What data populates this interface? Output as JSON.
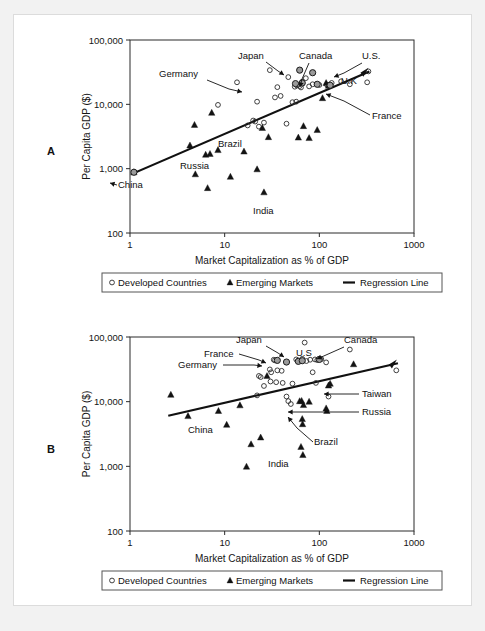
{
  "figure": {
    "background_color": "#f2f2f2",
    "card_color": "#ffffff",
    "panels": [
      {
        "letter": "A"
      },
      {
        "letter": "B"
      }
    ]
  },
  "legend": {
    "developed_label": "Developed Countries",
    "emerging_label": "Emerging Markets",
    "regression_label": "Regression Line",
    "developed_marker": "open-circle-icon",
    "emerging_marker": "filled-triangle-icon",
    "regression_marker": "line-segment-icon"
  },
  "chart_data": [
    {
      "panel": "A",
      "type": "scatter",
      "title": "",
      "xlabel": "Market Capitalization as % of GDP",
      "ylabel": "Per Capita GDP ($)",
      "xscale": "log",
      "yscale": "log",
      "xlim": [
        1,
        1000
      ],
      "ylim": [
        100,
        100000
      ],
      "xticks": [
        1,
        10,
        100,
        1000
      ],
      "xticklabels": [
        "1",
        "10",
        "100",
        "1000"
      ],
      "yticks": [
        100,
        1000,
        10000,
        100000
      ],
      "yticklabels": [
        "100",
        "1,000",
        "10,000",
        "100,000"
      ],
      "grid": false,
      "legend_position": "below-axis",
      "series": [
        {
          "name": "Developed Countries",
          "marker": "open-circle",
          "points": [
            [
              13.5,
              22000
            ],
            [
              8.5,
              9800
            ],
            [
              22.0,
              11000
            ],
            [
              30.0,
              34000
            ],
            [
              36.0,
              18500
            ],
            [
              34.0,
              12800
            ],
            [
              39.0,
              13500
            ],
            [
              47.0,
              26500
            ],
            [
              55.0,
              18800
            ],
            [
              58.0,
              19600
            ],
            [
              62.0,
              19200
            ],
            [
              64.0,
              18300
            ],
            [
              66.0,
              22500
            ],
            [
              72.0,
              25500
            ],
            [
              78.0,
              19000
            ],
            [
              85.0,
              20500
            ],
            [
              100.0,
              20000
            ],
            [
              120.0,
              20200
            ],
            [
              135.0,
              21500
            ],
            [
              170.0,
              22800
            ],
            [
              210.0,
              20500
            ],
            [
              320.0,
              22000
            ],
            [
              330.0,
              32500
            ],
            [
              17.5,
              4700
            ],
            [
              20.0,
              5600
            ],
            [
              21.0,
              5400
            ],
            [
              23.0,
              4500
            ],
            [
              26.0,
              5200
            ],
            [
              45.0,
              5000
            ],
            [
              52.0,
              10800
            ],
            [
              57.0,
              11000
            ]
          ]
        },
        {
          "name": "Emerging Markets",
          "marker": "filled-triangle",
          "points": [
            [
              1.1,
              880
            ],
            [
              4.3,
              2300
            ],
            [
              4.8,
              4800
            ],
            [
              4.9,
              820
            ],
            [
              6.3,
              1650
            ],
            [
              7.0,
              1700
            ],
            [
              7.3,
              7400
            ],
            [
              6.6,
              500
            ],
            [
              8.5,
              1950
            ],
            [
              11.5,
              750
            ],
            [
              16.0,
              1850
            ],
            [
              22.0,
              980
            ],
            [
              25.0,
              4300
            ],
            [
              26.0,
              430
            ],
            [
              29.0,
              3100
            ],
            [
              60.0,
              3050
            ],
            [
              68.0,
              4600
            ],
            [
              78.0,
              3000
            ],
            [
              95.0,
              4000
            ],
            [
              108.0,
              12500
            ],
            [
              118.0,
              21500
            ],
            [
              125.0,
              19500
            ]
          ]
        },
        {
          "name": "Named Countries",
          "marker": "filled-gray-circle",
          "points": [
            {
              "label": "Germany",
              "x": 56.0,
              "y": 21000
            },
            {
              "label": "Japan",
              "x": 62.0,
              "y": 34000
            },
            {
              "label": "Canada",
              "x": 66.0,
              "y": 21500
            },
            {
              "label": "U.S.",
              "x": 85.0,
              "y": 31000
            },
            {
              "label": "U.K",
              "x": 95.0,
              "y": 20500
            },
            {
              "label": "France",
              "x": 130.0,
              "y": 19800
            },
            {
              "label": "China",
              "x": 1.1,
              "y": 880
            }
          ]
        }
      ],
      "regression": {
        "x0": 1.05,
        "y0": 830,
        "x1": 330.0,
        "y1": 32000
      },
      "annotations": [
        "Japan",
        "Canada",
        "U.S.",
        "U.K",
        "Germany",
        "France",
        "China",
        "Russia",
        "Brazil",
        "India"
      ]
    },
    {
      "panel": "B",
      "type": "scatter",
      "title": "",
      "xlabel": "Market Capitalization as % of GDP",
      "ylabel": "Per Capita GDP ($)",
      "xscale": "log",
      "yscale": "log",
      "xlim": [
        1,
        1000
      ],
      "ylim": [
        100,
        100000
      ],
      "xticks": [
        1,
        10,
        100,
        1000
      ],
      "xticklabels": [
        "1",
        "10",
        "100",
        "1000"
      ],
      "yticks": [
        100,
        1000,
        10000,
        100000
      ],
      "yticklabels": [
        "100",
        "1,000",
        "10,000",
        "100,000"
      ],
      "grid": false,
      "legend_position": "below-axis",
      "series": [
        {
          "name": "Developed Countries",
          "marker": "open-circle",
          "points": [
            [
              23.0,
              25000
            ],
            [
              24.0,
              24000
            ],
            [
              26.0,
              17500
            ],
            [
              30.0,
              31500
            ],
            [
              31.0,
              28500
            ],
            [
              30.5,
              20500
            ],
            [
              33.0,
              44500
            ],
            [
              34.0,
              43500
            ],
            [
              36.0,
              30500
            ],
            [
              35.0,
              20000
            ],
            [
              40.0,
              30000
            ],
            [
              41.0,
              19500
            ],
            [
              45.0,
              12000
            ],
            [
              47.0,
              10200
            ],
            [
              50.0,
              9200
            ],
            [
              52.0,
              19000
            ],
            [
              57.0,
              45000
            ],
            [
              60.0,
              43000
            ],
            [
              66.0,
              46000
            ],
            [
              70.0,
              82000
            ],
            [
              73.0,
              42500
            ],
            [
              80.0,
              44500
            ],
            [
              85.0,
              28500
            ],
            [
              90.0,
              45000
            ],
            [
              95.0,
              44000
            ],
            [
              105.0,
              45500
            ],
            [
              118.0,
              40500
            ],
            [
              125.0,
              12000
            ],
            [
              92.0,
              19500
            ],
            [
              210.0,
              64000
            ],
            [
              650.0,
              30500
            ],
            [
              22.0,
              12500
            ]
          ]
        },
        {
          "name": "Emerging Markets",
          "marker": "filled-triangle",
          "points": [
            [
              2.7,
              12800
            ],
            [
              4.1,
              6000
            ],
            [
              8.6,
              7200
            ],
            [
              10.5,
              4400
            ],
            [
              14.5,
              8800
            ],
            [
              17.0,
              990
            ],
            [
              19.0,
              2200
            ],
            [
              24.0,
              2800
            ],
            [
              28.0,
              25000
            ],
            [
              62.0,
              10200
            ],
            [
              64.0,
              2000
            ],
            [
              65.0,
              10300
            ],
            [
              66.0,
              5400
            ],
            [
              66.5,
              4500
            ],
            [
              67.0,
              1500
            ],
            [
              68.0,
              8900
            ],
            [
              78.0,
              10000
            ],
            [
              118.0,
              7900
            ],
            [
              120.0,
              7200
            ],
            [
              125.0,
              17800
            ],
            [
              130.0,
              19000
            ],
            [
              230.0,
              38000
            ]
          ]
        },
        {
          "name": "Named Countries",
          "marker": "filled-gray-circle",
          "points": [
            {
              "label": "Germany",
              "x": 45.0,
              "y": 41000
            },
            {
              "label": "France",
              "x": 36.0,
              "y": 43500
            },
            {
              "label": "Japan",
              "x": 60.0,
              "y": 42000
            },
            {
              "label": "U.S",
              "x": 66.0,
              "y": 43000
            },
            {
              "label": "Canada",
              "x": 100.0,
              "y": 45000
            }
          ]
        }
      ],
      "regression": {
        "x0": 2.6,
        "y0": 6100,
        "x1": 660.0,
        "y1": 39000
      },
      "annotations": [
        "Japan",
        "France",
        "Germany",
        "U.S",
        "Canada",
        "Taiwan",
        "Russia",
        "Brazil",
        "China",
        "India"
      ]
    }
  ]
}
